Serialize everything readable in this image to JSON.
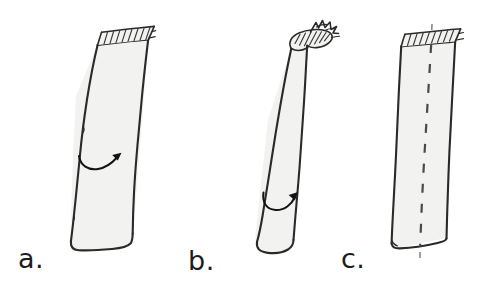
{
  "figure": {
    "title": "",
    "background_color": "#ffffff",
    "ink_color": "#2a2a2a",
    "fill_color": "#f2f2f0",
    "style": "hand-drawn line sketch",
    "width": 479,
    "height": 294,
    "panels": [
      {
        "id": "a",
        "label": "a.",
        "label_x": 18,
        "label_y": 268,
        "shape": "tilted rectangular prism (column) with slanted hatched top face",
        "top_face": "hatched slanted ellipse-parallelogram",
        "annotation": "curved arrow pointing right across the column face",
        "arrow_direction": "right",
        "has_axis_line": false
      },
      {
        "id": "b",
        "label": "b.",
        "label_x": 188,
        "label_y": 270,
        "shape": "tilted cylinder with rounded bottom and hatched elliptical top",
        "top_face": "hatched ellipse with jagged broken spike on the right",
        "annotation": "U-shaped curved arrow wrapping around the cylinder, pointing right",
        "arrow_direction": "right",
        "has_axis_line": false
      },
      {
        "id": "c",
        "label": "c.",
        "label_x": 341,
        "label_y": 268,
        "shape": "tilted rectangular prism (column) with slanted hatched top face",
        "top_face": "hatched slanted ellipse-parallelogram",
        "annotation": "vertical dashed centre axis line running through the column and extending above and below it",
        "arrow_direction": "none",
        "has_axis_line": true
      }
    ]
  }
}
